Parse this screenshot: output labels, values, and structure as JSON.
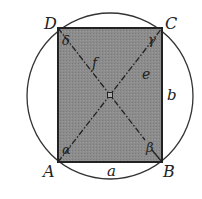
{
  "diagram": {
    "vertices": {
      "A": "A",
      "B": "B",
      "C": "C",
      "D": "D"
    },
    "sides": {
      "a": "a",
      "b": "b"
    },
    "diagonals": {
      "e": "e",
      "f": "f"
    },
    "angles": {
      "alpha": "α",
      "beta": "β",
      "gamma": "γ",
      "delta": "δ"
    },
    "colors": {
      "fill": "#8a8a8a",
      "stroke": "#2a2a2a",
      "circle": "#333333"
    }
  }
}
